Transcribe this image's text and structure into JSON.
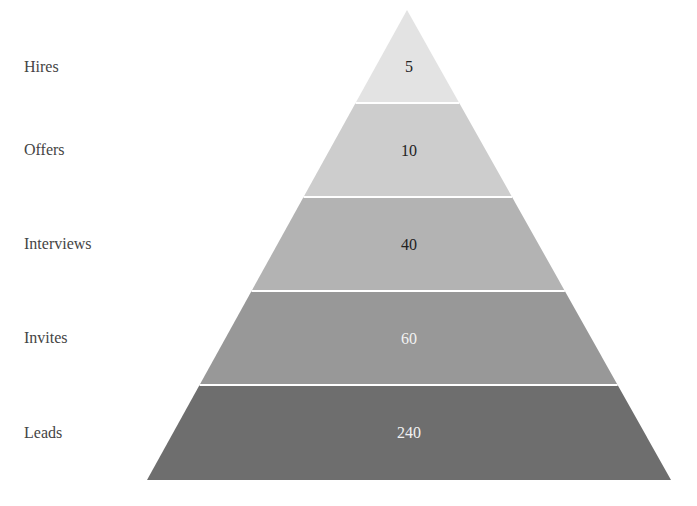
{
  "chart_data": {
    "type": "pyramid",
    "title": "",
    "categories": [
      "Hires",
      "Offers",
      "Interviews",
      "Invites",
      "Leads"
    ],
    "values": [
      5,
      10,
      40,
      60,
      240
    ],
    "colors": [
      "#e3e3e3",
      "#cdcdcd",
      "#b3b3b3",
      "#989898",
      "#6e6e6e"
    ],
    "value_label_colors": [
      "#222222",
      "#222222",
      "#222222",
      "#f2f2f2",
      "#f2f2f2"
    ],
    "layout": {
      "apex": [
        407,
        10
      ],
      "base_left": [
        147,
        480
      ],
      "base_right": [
        671,
        480
      ],
      "boundaries_y": [
        10,
        103,
        197,
        291,
        385,
        480
      ],
      "separator_color": "#ffffff",
      "legend": "none",
      "grid": false
    }
  }
}
